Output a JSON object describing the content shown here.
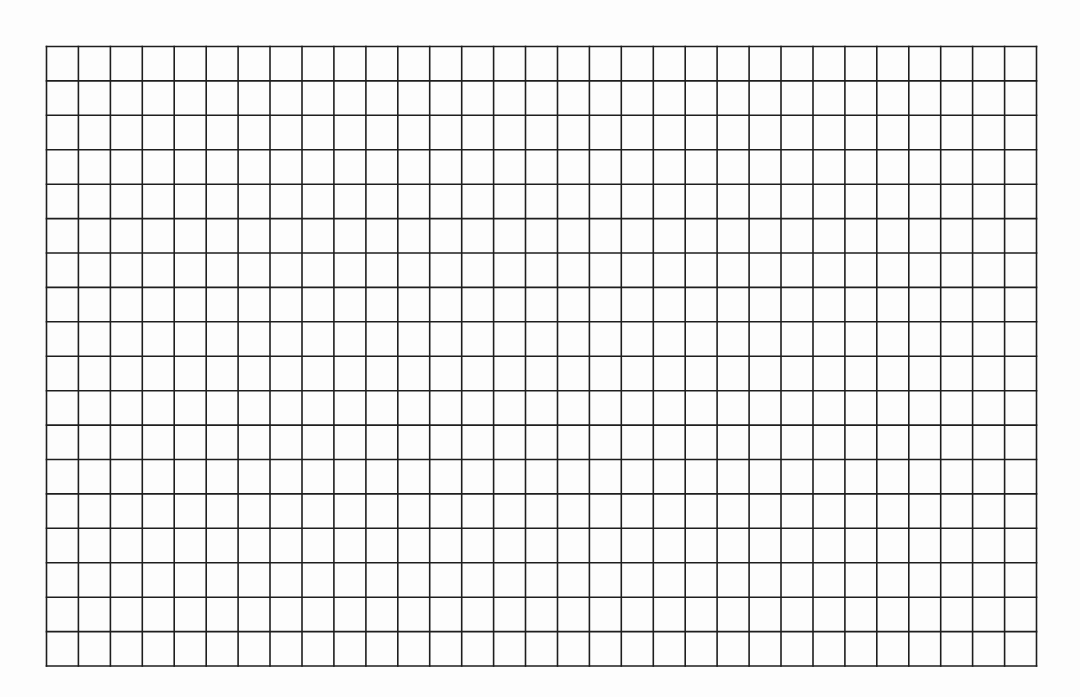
{
  "document": {
    "type": "blank-grid-sheet",
    "description": "Empty ruled grid on scanned paper",
    "grid": {
      "columns": 31,
      "rows": 18,
      "cells_filled": 0
    },
    "colors": {
      "paper": "#fdfdfd",
      "line": "#1e1e1e"
    },
    "text_content": []
  }
}
